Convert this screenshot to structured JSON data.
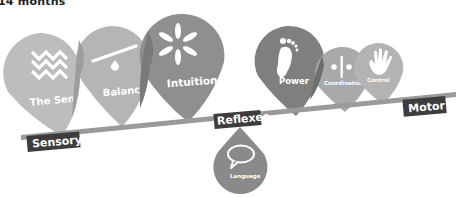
{
  "title": "14 months",
  "axis": {
    "left_label": "Sensory",
    "center_label": "Reflexes",
    "right_label": "Motor"
  },
  "pins": [
    {
      "label": "The Senses",
      "icon": "zigzag-waves-icon",
      "shade": "#bdbdbd"
    },
    {
      "label": "Balance",
      "icon": "seesaw-icon",
      "shade": "#b1b1b1"
    },
    {
      "label": "Intuition",
      "icon": "asterisk-burst-icon",
      "shade": "#8f8f8f"
    },
    {
      "label": "Power",
      "icon": "footprint-icon",
      "shade": "#7f7f7f"
    },
    {
      "label": "Coordination",
      "icon": "divider-dots-icon",
      "shade": "#a9a9a9"
    },
    {
      "label": "Control",
      "icon": "hand-icon",
      "shade": "#b3b3b3"
    },
    {
      "label": "Language",
      "icon": "speech-bubble-icon",
      "shade": "#8a8a8a"
    }
  ],
  "colors": {
    "beam": "#9a9a9a",
    "tag_bg": "#3d3d3d",
    "overlap": "#7a7a7a"
  }
}
